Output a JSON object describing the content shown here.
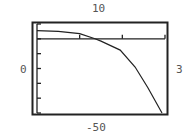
{
  "window": {
    "ymax_label": "10",
    "ymin_label": "-50",
    "xmin_label": "0",
    "xmax_label": "3"
  },
  "chart_data": {
    "type": "line",
    "title": "",
    "xlabel": "",
    "ylabel": "",
    "xlim": [
      0,
      3
    ],
    "ylim": [
      -50,
      10
    ],
    "x_ticks": [
      1,
      2,
      3
    ],
    "y_ticks": [
      10,
      0,
      -10,
      -20,
      -30,
      -40,
      -50
    ],
    "grid": false,
    "legend": null,
    "series": [
      {
        "name": "f(x)",
        "x": [
          0,
          0.5,
          1,
          1.36,
          1.5,
          1.95,
          2.3,
          2.6,
          2.93
        ],
        "values": [
          5.5,
          5,
          3.5,
          0,
          -1.5,
          -7.6,
          -19,
          -33,
          -50
        ]
      }
    ]
  }
}
